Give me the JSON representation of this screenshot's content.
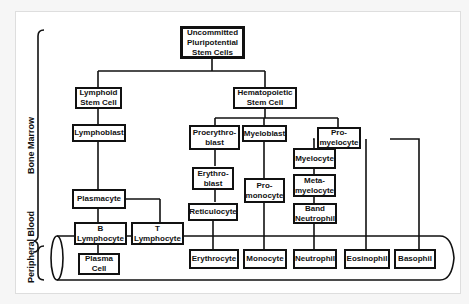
{
  "regions": {
    "bone_marrow": "Bone Marrow",
    "peripheral_blood": "Peripheral Blood"
  },
  "nodes": {
    "root": "Uncommitted\nPluripotential\nStem Cells",
    "lymphoid": "Lymphoid\nStem Cell",
    "hematopoietic": "Hematopoietic\nStem Cell",
    "lymphoblast": "Lymphoblast",
    "proerythroblast": "Proerythro-\nblast",
    "myeloblast": "Myeloblast",
    "promyelocyte": "Pro-\nmyelocyte",
    "myelocyte": "Myelocyte",
    "erythroblast": "Erythro-\nblast",
    "promonocyte": "Pro-\nmonocyte",
    "metamyelocyte": "Meta-\nmyelocyte",
    "plasmacyte": "Plasmacyte",
    "reticulocyte": "Reticulocyte",
    "band_neutrophil": "Band\nNeutrophil",
    "b_lymphocyte": "B\nLymphocyte",
    "t_lymphocyte": "T\nLymphocyte",
    "plasma_cell": "Plasma\nCell",
    "erythrocyte": "Erythrocyte",
    "monocyte": "Monocyte",
    "neutrophil": "Neutrophil",
    "eosinophil": "Eosinophil",
    "basophil": "Basophil"
  }
}
